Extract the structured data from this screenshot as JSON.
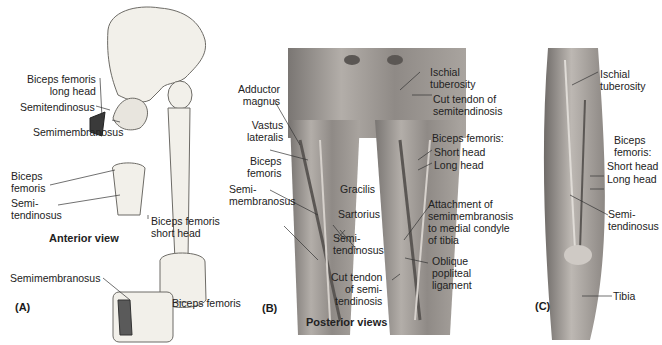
{
  "figure": {
    "panels": {
      "A": {
        "tag": "(A)",
        "view_caption": "Anterior view",
        "labels": {
          "biceps_long": "Biceps femoris\nlong head",
          "semitendinosus": "Semitendinosus",
          "semimembranosus_top": "Semimembranosus",
          "biceps_inset": "Biceps\nfemoris",
          "semitendinosus_inset": "Semi-\ntendinosus",
          "biceps_short": "Biceps femoris\nshort head",
          "semimembranosus_knee": "Semimembranosus",
          "biceps_knee": "Biceps femoris"
        }
      },
      "B": {
        "tag": "(B)",
        "labels": {
          "adductor_magnus": "Adductor\nmagnus",
          "vastus_lateralis": "Vastus\nlateralis",
          "biceps_femoris": "Biceps\nfemoris",
          "semimembranosus": "Semi-\nmembranosus",
          "gracilis": "Gracilis",
          "sartorius": "Sartorius",
          "semitendinosus": "Semi-\ntendinosus",
          "cut_tendon_bottom": "Cut tendon\nof semi-\ntendinosis",
          "ischial_tuberosity": "Ischial\ntuberosity",
          "cut_tendon_top": "Cut tendon of\nsemitendinosis",
          "biceps_heads_title": "Biceps femoris:",
          "short_head": "Short head",
          "long_head": "Long head",
          "attachment": "Attachment of\nsemimembranosis\nto medial condyle\nof tibia",
          "oblique_popliteal": "Oblique\npopliteal\nligament"
        }
      },
      "C": {
        "tag": "(C)",
        "labels": {
          "ischial_tuberosity": "Ischial\ntuberosity",
          "biceps_title": "Biceps\nfemoris:",
          "short_head": "Short head",
          "long_head": "Long head",
          "semitendinosus": "Semi-\ntendinosus",
          "tibia": "Tibia"
        }
      }
    },
    "shared_caption": "Posterior views",
    "colors": {
      "bone_fill": "#f2f0ea",
      "bone_stroke": "#6d6b66",
      "muscle_dark": "#3a3a3a",
      "photo_bg": "#8e8a86",
      "photo_light": "#c9c5c0"
    }
  }
}
